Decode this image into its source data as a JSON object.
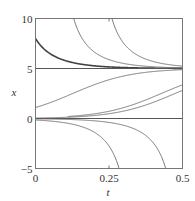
{
  "chart_data": {
    "type": "line",
    "title": "",
    "xlabel": "t",
    "ylabel": "x",
    "xlim": [
      0,
      0.5
    ],
    "ylim": [
      -5,
      10
    ],
    "xticks": [
      0,
      0.25,
      0.5
    ],
    "xtick_labels": [
      "0",
      "0.25",
      "0.5"
    ],
    "yticks": [
      -5,
      0,
      5,
      10
    ],
    "ytick_labels": [
      "−5",
      "0",
      "5",
      "10"
    ],
    "grid": false,
    "legend": "none",
    "model": "logistic x' = r x (1 - x/K)",
    "r": 10,
    "K": 5,
    "equilibria": [
      0,
      5
    ],
    "series": [
      {
        "name": "x0=8",
        "x0": 8,
        "t_shift": 0,
        "emphasis": true
      },
      {
        "name": "from-above-1",
        "x0": 10,
        "t_shift": 0.13,
        "emphasis": false
      },
      {
        "name": "from-above-2",
        "x0": 10,
        "t_shift": 0.26,
        "emphasis": false
      },
      {
        "name": "equilibrium-5",
        "x0": 5,
        "t_shift": 0,
        "emphasis": false
      },
      {
        "name": "x0=1.1",
        "x0": 1.1,
        "t_shift": 0,
        "emphasis": false
      },
      {
        "name": "x0=0.04",
        "x0": 0.043,
        "t_shift": 0,
        "emphasis": false
      },
      {
        "name": "x0=0.2",
        "x0": 0.2,
        "t_shift": 0.11,
        "emphasis": false
      },
      {
        "name": "equilibrium-0",
        "x0": 0,
        "t_shift": 0,
        "emphasis": false
      },
      {
        "name": "x0=-0.15",
        "x0": -0.15,
        "t_shift": 0,
        "emphasis": false
      },
      {
        "name": "x0=-0.03",
        "x0": -0.03,
        "t_shift": 0,
        "emphasis": false
      }
    ]
  }
}
